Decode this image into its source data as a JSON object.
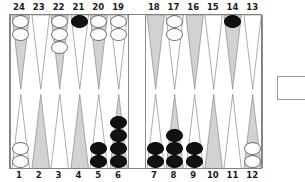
{
  "board": {
    "game": "backgammon",
    "colors": {
      "point_gray": "#d2d2d2",
      "point_white": "#ffffff",
      "point_outline": "#8a8a8a",
      "checker_white": "#fdfdfd",
      "checker_black": "#111111",
      "board_background": "#ffffff",
      "border": "#808080",
      "label_text": "#1a1a1a"
    },
    "bar": {
      "label": "bar",
      "white_checkers": 0,
      "black_checkers": 0
    },
    "bear_off_tray": {
      "label": "bear-off-tray",
      "checkers": 0
    },
    "top_labels": [
      "24",
      "23",
      "22",
      "21",
      "20",
      "19",
      "18",
      "17",
      "16",
      "15",
      "14",
      "13"
    ],
    "bottom_labels": [
      "1",
      "2",
      "3",
      "4",
      "5",
      "6",
      "7",
      "8",
      "9",
      "10",
      "11",
      "12"
    ],
    "points": [
      {
        "number": "24",
        "row": "top",
        "half": "left",
        "shade": "gray",
        "color": "white",
        "count": 2
      },
      {
        "number": "23",
        "row": "top",
        "half": "left",
        "shade": "white",
        "color": "none",
        "count": 0
      },
      {
        "number": "22",
        "row": "top",
        "half": "left",
        "shade": "gray",
        "color": "white",
        "count": 3
      },
      {
        "number": "21",
        "row": "top",
        "half": "left",
        "shade": "white",
        "color": "black",
        "count": 1
      },
      {
        "number": "20",
        "row": "top",
        "half": "left",
        "shade": "gray",
        "color": "white",
        "count": 2
      },
      {
        "number": "19",
        "row": "top",
        "half": "left",
        "shade": "white",
        "color": "white",
        "count": 2
      },
      {
        "number": "18",
        "row": "top",
        "half": "right",
        "shade": "gray",
        "color": "none",
        "count": 0
      },
      {
        "number": "17",
        "row": "top",
        "half": "right",
        "shade": "white",
        "color": "white",
        "count": 2
      },
      {
        "number": "16",
        "row": "top",
        "half": "right",
        "shade": "gray",
        "color": "none",
        "count": 0
      },
      {
        "number": "15",
        "row": "top",
        "half": "right",
        "shade": "white",
        "color": "none",
        "count": 0
      },
      {
        "number": "14",
        "row": "top",
        "half": "right",
        "shade": "gray",
        "color": "black",
        "count": 1
      },
      {
        "number": "13",
        "row": "top",
        "half": "right",
        "shade": "white",
        "color": "none",
        "count": 0
      },
      {
        "number": "1",
        "row": "bottom",
        "half": "left",
        "shade": "white",
        "color": "white",
        "count": 2
      },
      {
        "number": "2",
        "row": "bottom",
        "half": "left",
        "shade": "gray",
        "color": "none",
        "count": 0
      },
      {
        "number": "3",
        "row": "bottom",
        "half": "left",
        "shade": "white",
        "color": "none",
        "count": 0
      },
      {
        "number": "4",
        "row": "bottom",
        "half": "left",
        "shade": "gray",
        "color": "none",
        "count": 0
      },
      {
        "number": "5",
        "row": "bottom",
        "half": "left",
        "shade": "white",
        "color": "black",
        "count": 2
      },
      {
        "number": "6",
        "row": "bottom",
        "half": "left",
        "shade": "gray",
        "color": "black",
        "count": 4
      },
      {
        "number": "7",
        "row": "bottom",
        "half": "right",
        "shade": "white",
        "color": "black",
        "count": 2
      },
      {
        "number": "8",
        "row": "bottom",
        "half": "right",
        "shade": "gray",
        "color": "black",
        "count": 3
      },
      {
        "number": "9",
        "row": "bottom",
        "half": "right",
        "shade": "white",
        "color": "black",
        "count": 2
      },
      {
        "number": "10",
        "row": "bottom",
        "half": "right",
        "shade": "gray",
        "color": "none",
        "count": 0
      },
      {
        "number": "11",
        "row": "bottom",
        "half": "right",
        "shade": "white",
        "color": "none",
        "count": 0
      },
      {
        "number": "12",
        "row": "bottom",
        "half": "right",
        "shade": "gray",
        "color": "white",
        "count": 2
      }
    ]
  }
}
